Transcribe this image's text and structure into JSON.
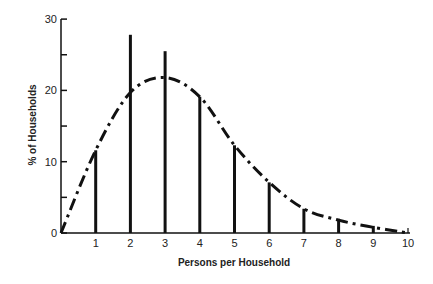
{
  "chart_data": {
    "type": "bar",
    "title": "",
    "xlabel": "Persons per Household",
    "ylabel": "% of Households",
    "xlim": [
      0,
      10
    ],
    "ylim": [
      0,
      30
    ],
    "grid": false,
    "legend": null,
    "x_ticks": [
      "1",
      "2",
      "3",
      "4",
      "5",
      "6",
      "7",
      "8",
      "9",
      "10"
    ],
    "y_ticks": [
      "0",
      "10",
      "20",
      "30"
    ],
    "series": [
      {
        "name": "Observed distribution",
        "style": "vertical lines",
        "x": [
          1,
          2,
          3,
          4,
          5,
          6,
          7,
          8,
          9
        ],
        "values": [
          11.6,
          27.8,
          25.5,
          19.1,
          12.3,
          7.1,
          3.4,
          2.0,
          1.0
        ]
      },
      {
        "name": "Fitted curve",
        "style": "dash-dot line",
        "x": [
          0,
          1,
          2,
          3,
          4,
          5,
          6,
          7,
          8,
          9,
          10
        ],
        "values": [
          0,
          11.6,
          19.7,
          21.8,
          19.1,
          12.3,
          7.1,
          3.4,
          1.8,
          0.8,
          0
        ]
      }
    ]
  }
}
